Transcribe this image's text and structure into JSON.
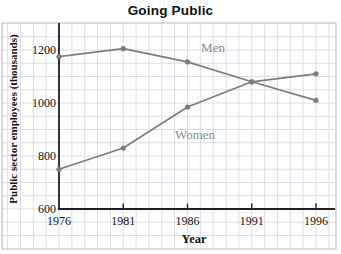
{
  "title": "Going Public",
  "style": {
    "background": "#ffffff",
    "grid_color": "#dbdee6",
    "box_border_color": "#b7b7bd",
    "axis_color": "#1f1f1f",
    "series_color": "#7d7d7d",
    "series_label_color": "#8a8a8a",
    "text_color": "#141414"
  },
  "chart_data": {
    "type": "line",
    "title": "Going Public",
    "xlabel": "Year",
    "ylabel": "Public sector employees (thousands)",
    "x": [
      1976,
      1981,
      1986,
      1991,
      1996
    ],
    "x_tick_labels": [
      "1976",
      "1981",
      "1986",
      "1991",
      "1996"
    ],
    "y_ticks": [
      600,
      800,
      1000,
      1200
    ],
    "y_tick_labels": [
      "600",
      "800",
      "1000",
      "1200"
    ],
    "xlim": [
      1976,
      1997.5
    ],
    "ylim": [
      600,
      1300
    ],
    "grid": true,
    "minor_grid_step_x_years": 1,
    "minor_grid_step_y": 50,
    "legend_position": "inline-annotations",
    "series": [
      {
        "name": "Men",
        "values": [
          1175,
          1205,
          1155,
          1080,
          1010
        ]
      },
      {
        "name": "Women",
        "values": [
          750,
          830,
          985,
          1080,
          1110
        ]
      }
    ]
  }
}
